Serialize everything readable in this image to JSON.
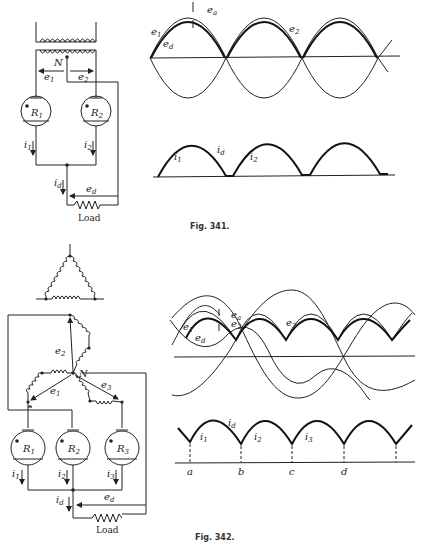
{
  "figures": [
    {
      "caption": "Fig. 341.",
      "circuit": {
        "tubes": [
          {
            "label": "R",
            "sub": "1"
          },
          {
            "label": "R",
            "sub": "2"
          }
        ],
        "labels": {
          "neutral": "N",
          "e1": "e",
          "e1_sub": "1",
          "e2": "e",
          "e2_sub": "2",
          "i1": "i",
          "i1_sub": "1",
          "i2": "i",
          "i2_sub": "2",
          "id": "i",
          "id_sub": "d",
          "ed": "e",
          "ed_sub": "d",
          "load": "Load"
        }
      },
      "voltage_plot": {
        "labels": {
          "e1": "e",
          "e1_sub": "1",
          "ed": "e",
          "ed_sub": "d",
          "ea": "e",
          "ea_sub": "a",
          "e2": "e",
          "e2_sub": "2"
        }
      },
      "current_plot": {
        "labels": {
          "i1": "i",
          "i1_sub": "1",
          "id": "i",
          "id_sub": "d",
          "i2": "i",
          "i2_sub": "2"
        }
      }
    },
    {
      "caption": "Fig. 342.",
      "circuit": {
        "tubes": [
          {
            "label": "R",
            "sub": "1"
          },
          {
            "label": "R",
            "sub": "2"
          },
          {
            "label": "R",
            "sub": "3"
          }
        ],
        "labels": {
          "neutral": "N",
          "e1": "e",
          "e1_sub": "1",
          "e2": "e",
          "e2_sub": "2",
          "e3": "e",
          "e3_sub": "3",
          "i1": "i",
          "i1_sub": "1",
          "i2": "i",
          "i2_sub": "2",
          "i3": "i",
          "i3_sub": "3",
          "id": "i",
          "id_sub": "d",
          "ed": "e",
          "ed_sub": "d",
          "load": "Load"
        }
      },
      "voltage_plot": {
        "labels": {
          "e1": "e",
          "e1_sub": "1",
          "ed": "e",
          "ed_sub": "d",
          "ea": "e",
          "ea_sub": "a",
          "e2": "e",
          "e2_sub": "2",
          "e3": "e",
          "e3_sub": "3"
        }
      },
      "current_plot": {
        "labels": {
          "i1": "i",
          "i1_sub": "1",
          "id": "i",
          "id_sub": "d",
          "i2": "i",
          "i2_sub": "2",
          "i3": "i",
          "i3_sub": "3"
        },
        "markers": [
          "a",
          "b",
          "c",
          "d"
        ]
      }
    }
  ]
}
